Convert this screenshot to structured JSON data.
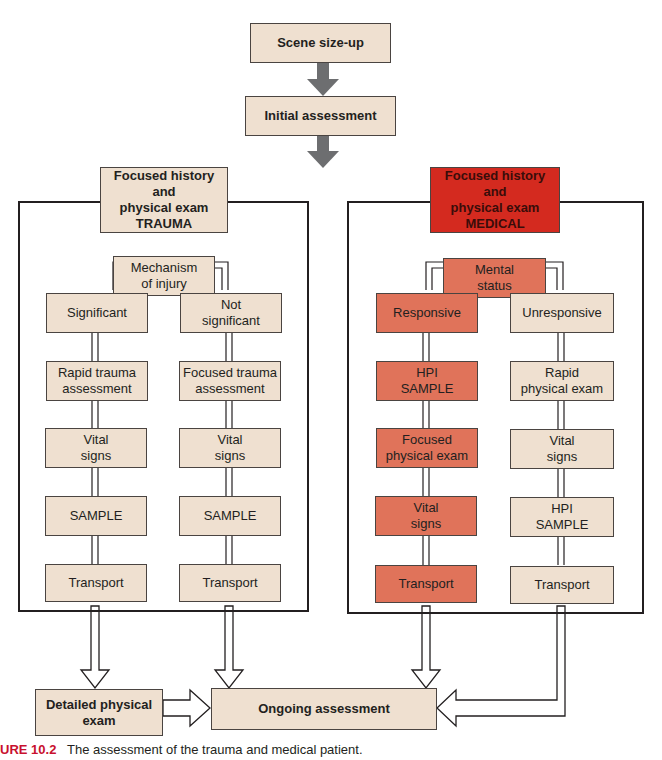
{
  "diagram": {
    "top": {
      "scene_sizeup": "Scene size-up",
      "initial_assessment": "Initial assessment"
    },
    "trauma": {
      "header": "Focused history\nand\nphysical exam\nTRAUMA",
      "root": "Mechanism\nof injury",
      "left_branch": [
        "Significant",
        "Rapid trauma\nassessment",
        "Vital\nsigns",
        "SAMPLE",
        "Transport"
      ],
      "right_branch": [
        "Not\nsignificant",
        "Focused trauma\nassessment",
        "Vital\nsigns",
        "SAMPLE",
        "Transport"
      ]
    },
    "medical": {
      "header": "Focused history\nand\nphysical exam\nMEDICAL",
      "root": "Mental\nstatus",
      "left_branch": [
        "Responsive",
        "HPI\nSAMPLE",
        "Focused\nphysical exam",
        "Vital\nsigns",
        "Transport"
      ],
      "right_branch": [
        "Unresponsive",
        "Rapid\nphysical exam",
        "Vital\nsigns",
        "HPI\nSAMPLE",
        "Transport"
      ]
    },
    "bottom": {
      "detailed_exam": "Detailed physical\nexam",
      "ongoing": "Ongoing assessment"
    },
    "colors": {
      "beige": "#efe0d0",
      "salmon": "#e0735a",
      "red": "#d42a1f",
      "arrow_gray": "#6d6e70"
    }
  },
  "caption": {
    "label": "URE 10.2",
    "text": "The assessment of the trauma and medical patient."
  }
}
